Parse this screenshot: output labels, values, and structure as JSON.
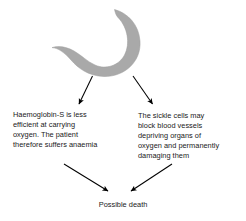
{
  "diagram": {
    "title_present": false,
    "background_color": "#ffffff",
    "text_color": "#1a1a1a",
    "arrow_color": "#000000",
    "cell": {
      "label": "sickle-cell",
      "fill_color": "#a9a9a9",
      "edge_color": "#9a9a9a"
    },
    "nodes": [
      {
        "id": "cause",
        "name": "sickle-cell-shape",
        "kind": "illustration",
        "text": ""
      },
      {
        "id": "effect-left",
        "name": "effect-anaemia",
        "kind": "text",
        "text": "Haemoglobin-S  is less\nefficient at carrying\noxygen. The patient\ntherefore suffers anaemia"
      },
      {
        "id": "effect-right",
        "name": "effect-blocked-vessels",
        "kind": "text",
        "text": "The sickle cells may\nblock blood vessels\ndepriving organs of\noxygen and permanently\ndamaging them"
      },
      {
        "id": "outcome",
        "name": "outcome-possible-death",
        "kind": "text",
        "text": "Possible death"
      }
    ],
    "arrows": [
      {
        "id": "arrow-cell-to-left",
        "from": "cause",
        "to": "effect-left",
        "direction": "down-left"
      },
      {
        "id": "arrow-cell-to-right",
        "from": "cause",
        "to": "effect-right",
        "direction": "down-right"
      },
      {
        "id": "arrow-left-to-death",
        "from": "effect-left",
        "to": "outcome",
        "direction": "down-right"
      },
      {
        "id": "arrow-right-to-death",
        "from": "effect-right",
        "to": "outcome",
        "direction": "down-left"
      }
    ]
  }
}
